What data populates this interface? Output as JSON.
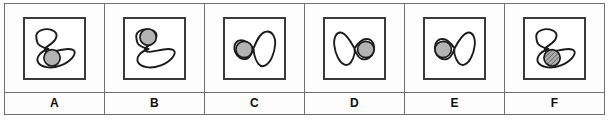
{
  "figure": {
    "type": "multiple-choice-option-strip",
    "option_count": 6,
    "shape_outline_color": "#1b1b1b",
    "frame_border_color": "#3a3a3a",
    "grid_line_color": "#6f6f6f",
    "background_color": "#ffffff"
  },
  "options": [
    {
      "label": "A",
      "shape_name": "diagonal-figure-eight",
      "shape_orientation": "diagonal",
      "circle_position": "lower-lobe",
      "circle_fill": "#b3b3b3",
      "circle_pattern": "solid"
    },
    {
      "label": "B",
      "shape_name": "diagonal-figure-eight",
      "shape_orientation": "diagonal",
      "circle_position": "upper-lobe",
      "circle_fill": "#b3b3b3",
      "circle_pattern": "solid"
    },
    {
      "label": "C",
      "shape_name": "horizontal-bowtie",
      "shape_orientation": "horizontal",
      "circle_position": "left-lobe",
      "circle_fill": "#b3b3b3",
      "circle_pattern": "solid"
    },
    {
      "label": "D",
      "shape_name": "horizontal-bowtie",
      "shape_orientation": "horizontal-mirrored",
      "circle_position": "right-lobe",
      "circle_fill": "#b3b3b3",
      "circle_pattern": "solid"
    },
    {
      "label": "E",
      "shape_name": "horizontal-bowtie",
      "shape_orientation": "horizontal",
      "circle_position": "left-lobe",
      "circle_fill": "#b3b3b3",
      "circle_pattern": "solid"
    },
    {
      "label": "F",
      "shape_name": "diagonal-figure-eight",
      "shape_orientation": "diagonal",
      "circle_position": "lower-lobe",
      "circle_fill": "#8c8c8c",
      "circle_pattern": "hatched"
    }
  ]
}
